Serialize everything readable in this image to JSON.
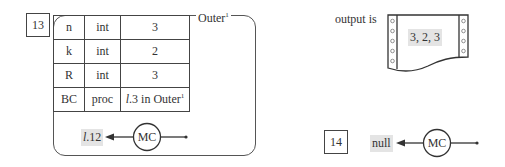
{
  "frame13": {
    "step_number": "13",
    "frame_name": "Outer",
    "frame_superscript": "1",
    "variables": [
      {
        "name": "n",
        "type": "int",
        "value": "3"
      },
      {
        "name": "k",
        "type": "int",
        "value": "2"
      },
      {
        "name": "R",
        "type": "int",
        "value": "3"
      },
      {
        "name": "BC",
        "type": "proc",
        "value_prefix": "l",
        "value_main": ".3 in Outer",
        "value_sup": "1"
      }
    ],
    "return_pointer": {
      "label_prefix": "l",
      "label_main": ".12",
      "node_label": "MC"
    }
  },
  "output": {
    "label": "output is",
    "text": "3, 2, 3"
  },
  "frame14": {
    "step_number": "14",
    "return_pointer": {
      "label": "null",
      "node_label": "MC"
    }
  }
}
